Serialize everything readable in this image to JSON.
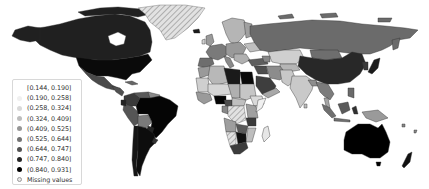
{
  "map": {
    "type": "choropleth",
    "projection": "world",
    "colormap": "grayscale (light to dark)",
    "missing_pattern": "hatched light gray",
    "regions": [
      {
        "name": "Canada",
        "class": 6
      },
      {
        "name": "United States",
        "class": 8
      },
      {
        "name": "Mexico",
        "class": 6
      },
      {
        "name": "Greenland",
        "class": "missing"
      },
      {
        "name": "Brazil",
        "class": 8
      },
      {
        "name": "Argentina",
        "class": 8
      },
      {
        "name": "Peru",
        "class": 6
      },
      {
        "name": "Bolivia",
        "class": 5
      },
      {
        "name": "Colombia",
        "class": 7
      },
      {
        "name": "Venezuela",
        "class": 6
      },
      {
        "name": "Russia",
        "class": 5
      },
      {
        "name": "China",
        "class": 7
      },
      {
        "name": "Kazakhstan",
        "class": 3
      },
      {
        "name": "Mongolia",
        "class": 5
      },
      {
        "name": "India",
        "class": 3
      },
      {
        "name": "Saudi Arabia",
        "class": 6
      },
      {
        "name": "Iran",
        "class": 4
      },
      {
        "name": "Libya",
        "class": 8
      },
      {
        "name": "Egypt",
        "class": 3
      },
      {
        "name": "Algeria",
        "class": 3
      },
      {
        "name": "Nigeria",
        "class": 8
      },
      {
        "name": "DR Congo",
        "class": "missing"
      },
      {
        "name": "South Africa",
        "class": 6
      },
      {
        "name": "Namibia",
        "class": "missing"
      },
      {
        "name": "Madagascar",
        "class": 2
      },
      {
        "name": "Australia",
        "class": 9
      },
      {
        "name": "New Zealand",
        "class": 8
      },
      {
        "name": "Indonesia",
        "class": 5
      },
      {
        "name": "Japan",
        "class": 8
      }
    ]
  },
  "legend": {
    "items": [
      {
        "label": "[0.144, 0.190]",
        "color": "#ffffff",
        "border": "#ffffff"
      },
      {
        "label": "(0.190, 0.258]",
        "color": "#f0f0f0",
        "border": "#f0f0f0"
      },
      {
        "label": "(0.258, 0.324]",
        "color": "#d9d9d9",
        "border": "#d9d9d9"
      },
      {
        "label": "(0.324, 0.409]",
        "color": "#bdbdbd",
        "border": "#bdbdbd"
      },
      {
        "label": "(0.409, 0.525]",
        "color": "#969696",
        "border": "#969696"
      },
      {
        "label": "(0.525, 0.644]",
        "color": "#737373",
        "border": "#737373"
      },
      {
        "label": "(0.644, 0.747]",
        "color": "#525252",
        "border": "#525252"
      },
      {
        "label": "(0.747, 0.840]",
        "color": "#252525",
        "border": "#252525"
      },
      {
        "label": "(0.840, 0.931]",
        "color": "#000000",
        "border": "#000000"
      },
      {
        "label": "Missing values",
        "color": "#e6e6e6",
        "border": "#999999"
      }
    ]
  },
  "palette": {
    "c1": "#ffffff",
    "c2": "#f0f0f0",
    "c3": "#d9d9d9",
    "c4": "#bdbdbd",
    "c5": "#969696",
    "c6": "#737373",
    "c7": "#525252",
    "c8": "#252525",
    "c9": "#000000",
    "missing": "#e0e0e0",
    "edge": "#333333"
  }
}
